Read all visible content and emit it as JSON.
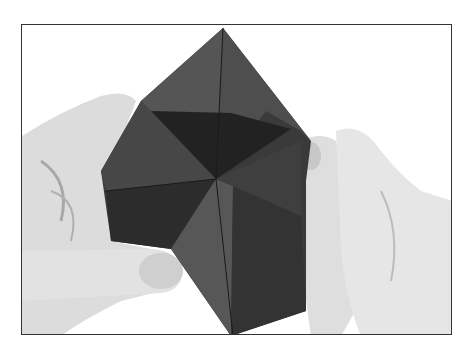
{
  "image": {
    "description": "Black and white photo of two hands holding a folded paper origami fortune teller / star fold",
    "colors": {
      "paper_dark": "#2a2a2a",
      "paper_mid": "#4a4a4a",
      "paper_light": "#5e5e5e",
      "skin_light": "#e4e4e4",
      "skin_shadow": "#b8b8b8",
      "frame": "#333333",
      "background": "#ffffff"
    }
  }
}
